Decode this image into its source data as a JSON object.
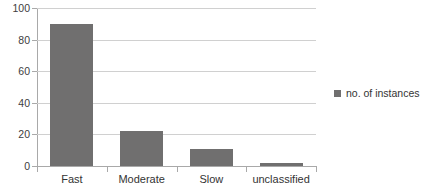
{
  "chart_data": {
    "type": "bar",
    "title": "",
    "subtitle": "",
    "xlabel": "",
    "ylabel": "",
    "categories": [
      "Fast",
      "Moderate",
      "Slow",
      "unclassified"
    ],
    "series": [
      {
        "name": "no. of instances",
        "values": [
          90,
          22,
          11,
          2
        ],
        "color": "#706F6F"
      }
    ],
    "ylim": [
      0,
      100
    ],
    "yticks": [
      0,
      20,
      40,
      60,
      80,
      100
    ],
    "ytick_labels": [
      "0",
      "20",
      "40",
      "60",
      "80",
      "100"
    ],
    "grid": true,
    "grid_axis": "y",
    "legend": {
      "position": "right",
      "entries": [
        {
          "label": "no. of instances",
          "color": "#706F6F",
          "marker": "square"
        }
      ]
    },
    "colors": {
      "background": "#ffffff",
      "bar": "#706F6F",
      "gridline": "#d0d0d0",
      "axis": "#a9a9a9",
      "text": "#333333"
    }
  }
}
